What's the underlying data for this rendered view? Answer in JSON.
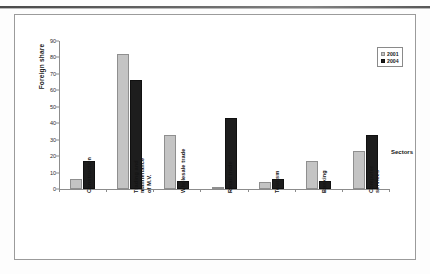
{
  "chart_data": {
    "type": "bar",
    "title": "",
    "xlabel": "Sectors",
    "ylabel": "Foreign share",
    "categories": [
      "Construction",
      "Trading and maintenance of M.V.",
      "Wholesale trade",
      "Retail trade",
      "Tourism",
      "Banking",
      "Computer services"
    ],
    "series": [
      {
        "name": "2001",
        "color": "#c4c4c4",
        "values": [
          6,
          82,
          33,
          1,
          4,
          17,
          23
        ]
      },
      {
        "name": "2004",
        "color": "#1d1d1d",
        "values": [
          17,
          66,
          5,
          43,
          6,
          5,
          33
        ]
      }
    ],
    "ylim": [
      0,
      90
    ],
    "ytick_step": 10,
    "ytick_labels": [
      "0",
      "10",
      "20",
      "30",
      "40",
      "50",
      "60",
      "70",
      "80",
      "90"
    ],
    "grid": false,
    "legend_position": "top-right-inside"
  }
}
